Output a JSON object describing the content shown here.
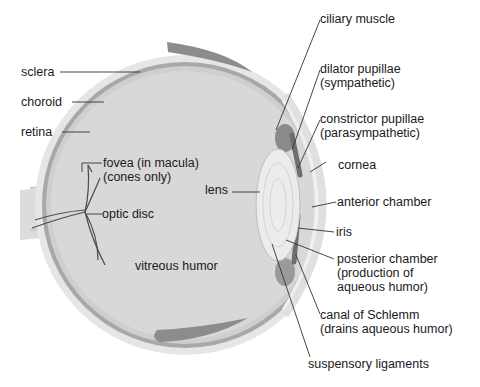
{
  "diagram": {
    "colors": {
      "background": "#ffffff",
      "sclera": "#e4e4e4",
      "choroid": "#a6a6a6",
      "retina": "#cfcfcf",
      "vitreous": "#d6d6d6",
      "lens": "#e8e8e8",
      "muscle": "#7a7a7a",
      "eyelid": "#8a8a8a",
      "text": "#1a1a1a",
      "leader": "#333333"
    },
    "labels": {
      "sclera": "sclera",
      "choroid": "choroid",
      "retina": "retina",
      "fovea_1": "fovea (in macula)",
      "fovea_2": "(cones only)",
      "optic_disc": "optic disc",
      "lens": "lens",
      "vitreous": "vitreous humor",
      "ciliary": "ciliary muscle",
      "dilator_1": "dilator pupillae",
      "dilator_2": "(sympathetic)",
      "constrictor_1": "constrictor pupillae",
      "constrictor_2": "(parasympathetic)",
      "cornea": "cornea",
      "anterior": "anterior chamber",
      "iris": "iris",
      "posterior_1": "posterior chamber",
      "posterior_2": "(production of",
      "posterior_3": "aqueous humor)",
      "schlemm_1": "canal of Schlemm",
      "schlemm_2": "(drains aqueous humor)",
      "suspensory": "suspensory ligaments"
    }
  }
}
